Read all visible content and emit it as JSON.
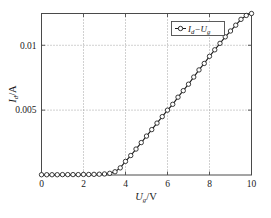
{
  "figure": {
    "background_color": "#ffffff",
    "frame_color": "#4a4a4a",
    "grid_color": "#8c8c8c",
    "series_color": "#1a1a1a"
  },
  "legend": {
    "entries": [
      {
        "label": "Id-Ug",
        "label_main_1": "I",
        "label_sub_1": "d",
        "label_dash": "−",
        "label_main_2": "U",
        "label_sub_2": "g",
        "marker": "circle-line-marker"
      }
    ],
    "position": "top-right"
  },
  "axes": {
    "x_title_main": "U",
    "x_title_sub": "g",
    "x_title_unit": "/V",
    "y_title_main": "I",
    "y_title_sub": "d",
    "y_title_unit": "/A",
    "x_ticks": [
      "0",
      "2",
      "4",
      "6",
      "8",
      "10"
    ],
    "y_ticks": [
      "0.005",
      "0.01"
    ]
  },
  "chart_data": {
    "type": "line",
    "title": "",
    "xlabel": "Ug/V",
    "ylabel": "Id/A",
    "xlim": [
      0,
      10
    ],
    "ylim": [
      0,
      0.01245
    ],
    "grid": true,
    "xticks": [
      0,
      2,
      4,
      6,
      8,
      10
    ],
    "yticks": [
      0.005,
      0.01
    ],
    "legend_position": "top-right",
    "series": [
      {
        "name": "Id-Ug",
        "marker": "circle",
        "x": [
          0.0,
          0.25,
          0.5,
          0.75,
          1.0,
          1.25,
          1.5,
          1.75,
          2.0,
          2.25,
          2.5,
          2.75,
          3.0,
          3.25,
          3.5,
          3.75,
          4.0,
          4.25,
          4.5,
          4.75,
          5.0,
          5.25,
          5.5,
          5.75,
          6.0,
          6.25,
          6.5,
          6.75,
          7.0,
          7.25,
          7.5,
          7.75,
          8.0,
          8.25,
          8.5,
          8.75,
          9.0,
          9.25,
          9.5,
          9.75,
          10.0
        ],
        "y": [
          2e-05,
          2e-05,
          2e-05,
          2e-05,
          3e-05,
          3e-05,
          3e-05,
          3e-05,
          4e-05,
          4e-05,
          5e-05,
          6e-05,
          8e-05,
          0.00013,
          0.00025,
          0.00055,
          0.00105,
          0.0015,
          0.002,
          0.0025,
          0.003,
          0.0035,
          0.004,
          0.0045,
          0.005,
          0.00545,
          0.006,
          0.0065,
          0.007,
          0.00755,
          0.0081,
          0.0086,
          0.00915,
          0.00965,
          0.01015,
          0.01065,
          0.0111,
          0.01155,
          0.012,
          0.0123,
          0.01245
        ]
      }
    ]
  }
}
